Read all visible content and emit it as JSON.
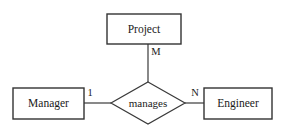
{
  "diagram": {
    "type": "entity-relationship",
    "title": "",
    "background_color": "#ffffff",
    "stroke_color": "#3a3a3a",
    "text_color": "#1a1a1a",
    "entities": [
      {
        "id": "project",
        "label": "Project",
        "shape": "rectangle",
        "x": 107,
        "y": 14,
        "width": 74,
        "height": 30
      },
      {
        "id": "manager",
        "label": "Manager",
        "shape": "rectangle",
        "x": 13,
        "y": 88,
        "width": 71,
        "height": 31
      },
      {
        "id": "engineer",
        "label": "Engineer",
        "shape": "rectangle",
        "x": 204,
        "y": 88,
        "width": 68,
        "height": 31
      }
    ],
    "relationships": [
      {
        "id": "manages",
        "label": "manages",
        "shape": "diamond",
        "center_x": 148,
        "center_y": 103,
        "half_width": 37,
        "half_height": 21
      }
    ],
    "connectors": [
      {
        "id": "project-manages",
        "from": "project",
        "to": "manages",
        "orientation": "vertical",
        "cardinality": "M",
        "label_x": 156,
        "label_y": 53
      },
      {
        "id": "manager-manages",
        "from": "manager",
        "to": "manages",
        "orientation": "horizontal",
        "cardinality": "1",
        "label_x": 90,
        "label_y": 94
      },
      {
        "id": "manages-engineer",
        "from": "manages",
        "to": "engineer",
        "orientation": "horizontal",
        "cardinality": "N",
        "label_x": 195,
        "label_y": 94
      }
    ]
  }
}
